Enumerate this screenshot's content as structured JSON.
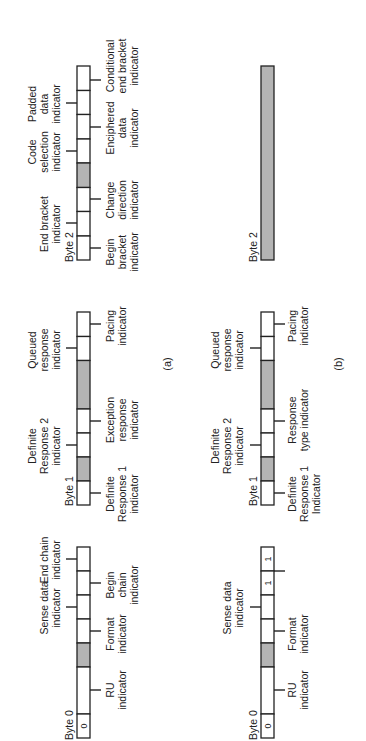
{
  "figure": {
    "orientation": "rotated-90-ccw",
    "colors": {
      "shaded": "#b4b4b4",
      "line": "#222222",
      "background": "#ffffff"
    },
    "panels": [
      {
        "id": "a",
        "caption": "(a)",
        "bytes": [
          {
            "label": "Byte 0",
            "cells": [
              {
                "span": 1,
                "value": "0",
                "shaded": false
              },
              {
                "span": 2,
                "value": "",
                "shaded": false
              },
              {
                "span": 1,
                "value": "",
                "shaded": true
              },
              {
                "span": 1,
                "value": "",
                "shaded": false
              },
              {
                "span": 1,
                "value": "",
                "shaded": false
              },
              {
                "span": 1,
                "value": "",
                "shaded": false
              },
              {
                "span": 1,
                "value": "",
                "shaded": false
              }
            ],
            "labels_above": [
              "Sense data indicator",
              "End chain indicator"
            ],
            "labels_below": [
              "RU indicator",
              "Format indicator",
              "Begin chain indicator"
            ]
          },
          {
            "label": "Byte 1",
            "cells": [
              {
                "span": 1,
                "value": "",
                "shaded": false
              },
              {
                "span": 1,
                "value": "",
                "shaded": true
              },
              {
                "span": 1,
                "value": "",
                "shaded": false
              },
              {
                "span": 1,
                "value": "",
                "shaded": false
              },
              {
                "span": 2,
                "value": "",
                "shaded": true
              },
              {
                "span": 1,
                "value": "",
                "shaded": false
              },
              {
                "span": 1,
                "value": "",
                "shaded": false
              }
            ],
            "labels_above": [
              "Definite Response 2 indicator",
              "Queued response indicator"
            ],
            "labels_below": [
              "Definite Response 1 indicator",
              "Exception response indicator",
              "Pacing indicator"
            ]
          },
          {
            "label": "Byte 2",
            "cells": [
              {
                "span": 1,
                "value": "",
                "shaded": false
              },
              {
                "span": 1,
                "value": "",
                "shaded": false
              },
              {
                "span": 1,
                "value": "",
                "shaded": false
              },
              {
                "span": 1,
                "value": "",
                "shaded": true
              },
              {
                "span": 1,
                "value": "",
                "shaded": false
              },
              {
                "span": 1,
                "value": "",
                "shaded": false
              },
              {
                "span": 1,
                "value": "",
                "shaded": false
              },
              {
                "span": 1,
                "value": "",
                "shaded": false
              }
            ],
            "labels_above": [
              "End bracket indicator",
              "Code selection indicator",
              "Padded data indicator"
            ],
            "labels_below": [
              "Begin bracket indicator",
              "Change direction indicator",
              "Enciphered data indicator",
              "Conditional end bracket indicator"
            ]
          }
        ]
      },
      {
        "id": "b",
        "caption": "(b)",
        "bytes": [
          {
            "label": "Byte 0",
            "cells": [
              {
                "span": 1,
                "value": "0",
                "shaded": false
              },
              {
                "span": 2,
                "value": "",
                "shaded": false
              },
              {
                "span": 1,
                "value": "",
                "shaded": true
              },
              {
                "span": 1,
                "value": "",
                "shaded": false
              },
              {
                "span": 1,
                "value": "",
                "shaded": false
              },
              {
                "span": 1,
                "value": "1",
                "shaded": false
              },
              {
                "span": 1,
                "value": "1",
                "shaded": false
              }
            ],
            "labels_above": [
              "Sense data indicator"
            ],
            "labels_below": [
              "RU indicator",
              "Format indicator"
            ]
          },
          {
            "label": "Byte 1",
            "cells": [
              {
                "span": 1,
                "value": "",
                "shaded": false
              },
              {
                "span": 1,
                "value": "",
                "shaded": true
              },
              {
                "span": 1,
                "value": "",
                "shaded": false
              },
              {
                "span": 1,
                "value": "",
                "shaded": false
              },
              {
                "span": 2,
                "value": "",
                "shaded": true
              },
              {
                "span": 1,
                "value": "",
                "shaded": false
              },
              {
                "span": 1,
                "value": "",
                "shaded": false
              }
            ],
            "labels_above": [
              "Definite Response 2 indicator",
              "Queued response indicator"
            ],
            "labels_below": [
              "Definite Response 1 Indicator",
              "Response type indicator",
              "Pacing indicator"
            ]
          },
          {
            "label": "Byte 2",
            "cells": [
              {
                "span": 8,
                "value": "",
                "shaded": true
              }
            ],
            "labels_above": [],
            "labels_below": []
          }
        ]
      }
    ]
  },
  "text": {
    "a": {
      "caption": "(a)",
      "b0": {
        "label": "Byte 0",
        "bit0": "0",
        "sense1": "Sense data",
        "sense2": "indicator",
        "endc1": "End chain",
        "endc2": "indicator",
        "ru1": "RU",
        "ru2": "indicator",
        "fmt1": "Format",
        "fmt2": "indicator",
        "begc1": "Begin",
        "begc2": "chain",
        "begc3": "indicator"
      },
      "b1": {
        "label": "Byte 1",
        "dr2_1": "Definite",
        "dr2_2": "Response 2",
        "dr2_3": "indicator",
        "qr1": "Queued",
        "qr2": "response",
        "qr3": "indicator",
        "dr1_1": "Definite",
        "dr1_2": "Response 1",
        "dr1_3": "indicator",
        "exc1": "Exception",
        "exc2": "response",
        "exc3": "indicator",
        "pac1": "Pacing",
        "pac2": "indicator"
      },
      "b2": {
        "label": "Byte 2",
        "eb1": "End bracket",
        "eb2": "indicator",
        "cs1": "Code",
        "cs2": "selection",
        "cs3": "indicator",
        "pd1": "Padded",
        "pd2": "data",
        "pd3": "indicator",
        "bb1": "Begin",
        "bb2": "bracket",
        "bb3": "indicator",
        "cd1": "Change",
        "cd2": "direction",
        "cd3": "indicator",
        "ed1": "Enciphered",
        "ed2": "data",
        "ed3": "indicator",
        "ceb1": "Conditional",
        "ceb2": "end bracket",
        "ceb3": "indicator"
      }
    },
    "b": {
      "caption": "(b)",
      "b0": {
        "label": "Byte 0",
        "bit0": "0",
        "bit6": "1",
        "bit7": "1",
        "sense1": "Sense data",
        "sense2": "indicator",
        "ru1": "RU",
        "ru2": "indicator",
        "fmt1": "Format",
        "fmt2": "indicator"
      },
      "b1": {
        "label": "Byte 1",
        "dr2_1": "Definite",
        "dr2_2": "Response 2",
        "dr2_3": "indicator",
        "qr1": "Queued",
        "qr2": "response",
        "qr3": "indicator",
        "dr1_1": "Definite",
        "dr1_2": "Response 1",
        "dr1_3": "Indicator",
        "rt1": "Response",
        "rt2": "type indicator",
        "pac1": "Pacing",
        "pac2": "indicator"
      },
      "b2": {
        "label": "Byte 2"
      }
    }
  }
}
